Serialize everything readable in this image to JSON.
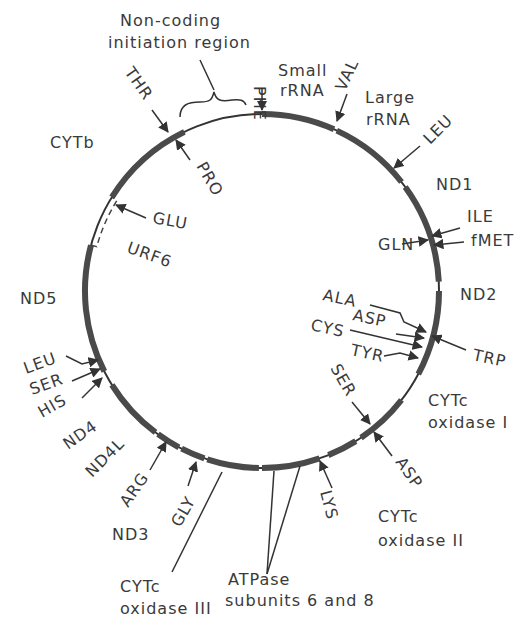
{
  "circle": {
    "cx": 262,
    "cy": 291,
    "r": 177
  },
  "gene_segments": [
    {
      "name": "Small rRNA",
      "from": 0,
      "to": 24
    },
    {
      "name": "Large rRNA",
      "from": 25,
      "to": 52
    },
    {
      "name": "ND1",
      "from": 54,
      "to": 87
    },
    {
      "name": "ND2",
      "from": 90,
      "to": 118
    },
    {
      "name": "CYTc oxidase I",
      "from": 128,
      "to": 146
    },
    {
      "name": "CYTc oxidase II",
      "from": 148,
      "to": 158
    },
    {
      "name": "ATPase subunits 6 and 8",
      "from": 161,
      "to": 180
    },
    {
      "name": "CYTc oxidase III",
      "from": 181,
      "to": 198
    },
    {
      "name": "ND3",
      "from": 199,
      "to": 207
    },
    {
      "name": "ND4L",
      "from": 208,
      "to": 216
    },
    {
      "name": "ND4",
      "from": 217,
      "to": 238
    },
    {
      "name": "ND5",
      "from": 243,
      "to": 285
    },
    {
      "name": "CYTb",
      "from": 302,
      "to": 334
    }
  ],
  "dashed_segment": {
    "name": "URF6",
    "from": 285,
    "to": 302
  },
  "labels": {
    "noncoding": [
      "Non-coding",
      "initiation region"
    ],
    "small_rrna": [
      "Small",
      "rRNA"
    ],
    "large_rrna": [
      "Large",
      "rRNA"
    ],
    "nd1": "ND1",
    "nd2": "ND2",
    "nd3": "ND3",
    "nd4": "ND4",
    "nd4l": "ND4L",
    "nd5": "ND5",
    "cytb": "CYTb",
    "urf6": "URF6",
    "cox1": [
      "CYTc",
      "oxidase I"
    ],
    "cox2": [
      "CYTc",
      "oxidase II"
    ],
    "cox3": [
      "CYTc",
      "oxidase III"
    ],
    "atpase": [
      "ATPase",
      "subunits 6 and 8"
    ]
  },
  "trna": {
    "phe": "PHE",
    "val": "VAL",
    "leu1": "LEU",
    "ile": "ILE",
    "fmet": "fMET",
    "gln": "GLN",
    "ala": "ALA",
    "asp1": "ASP",
    "cys": "CYS",
    "tyr": "TYR",
    "trp": "TRP",
    "ser1": "SER",
    "asp2": "ASP",
    "lys": "LYS",
    "gly": "GLY",
    "arg": "ARG",
    "leu2": "LEU",
    "ser2": "SER",
    "his": "HIS",
    "glu": "GLU",
    "pro": "PRO",
    "thr": "THR"
  }
}
